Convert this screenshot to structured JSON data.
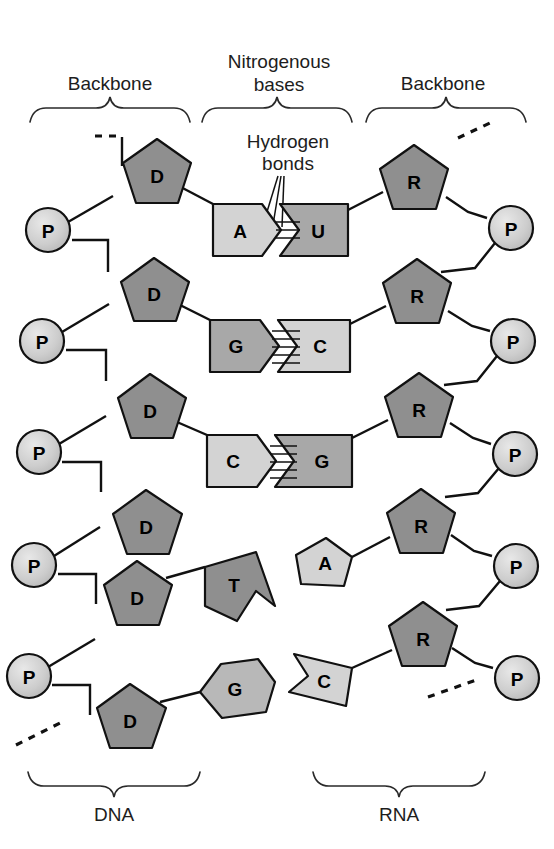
{
  "figure": {
    "title_top_left": "Backbone",
    "title_top_center_line1": "Nitrogenous",
    "title_top_center_line2": "bases",
    "title_top_right": "Backbone",
    "callout_line1": "Hydrogen",
    "callout_line2": "bonds",
    "label_bottom_left": "DNA",
    "label_bottom_right": "RNA"
  },
  "colors": {
    "sugar_fill": "#8f8f8f",
    "phosphate_fill": "#c9c9c9",
    "base_dark_fill": "#a8a8a8",
    "base_light_fill": "#d3d3d3",
    "outline": "#111111",
    "text": "#1d1d1d",
    "background": "#ffffff"
  },
  "dna": {
    "strand_label": "DNA",
    "sugar_symbol": "D",
    "sugar_name": "deoxyribose",
    "phosphate_symbol": "P",
    "sugar_count": 6,
    "phosphate_count": 5,
    "bases": [
      "A",
      "G",
      "C",
      "T",
      "G"
    ]
  },
  "rna": {
    "strand_label": "RNA",
    "sugar_symbol": "R",
    "sugar_name": "ribose",
    "phosphate_symbol": "P",
    "sugar_count": 5,
    "phosphate_count": 5,
    "bases": [
      "U",
      "C",
      "G",
      "A",
      "C"
    ]
  },
  "base_pairs": [
    {
      "left": "A",
      "right": "U",
      "left_shade": "light",
      "right_shade": "dark",
      "bond_count": 2
    },
    {
      "left": "G",
      "right": "C",
      "left_shade": "dark",
      "right_shade": "light",
      "bond_count": 3
    },
    {
      "left": "C",
      "right": "G",
      "left_shade": "light",
      "right_shade": "dark",
      "bond_count": 3
    }
  ],
  "unpaired": {
    "dna": [
      {
        "symbol": "T",
        "shade": "dark"
      },
      {
        "symbol": "G",
        "shade": "light"
      }
    ],
    "rna": [
      {
        "symbol": "A",
        "shade": "light"
      },
      {
        "symbol": "C",
        "shade": "light"
      }
    ]
  },
  "glyphs": {
    "dna_sugars": [
      "D",
      "D",
      "D",
      "D",
      "D",
      "D"
    ],
    "dna_phosphates": [
      "P",
      "P",
      "P",
      "P",
      "P"
    ],
    "rna_sugars": [
      "R",
      "R",
      "R",
      "R",
      "R"
    ],
    "rna_phosphates": [
      "P",
      "P",
      "P",
      "P",
      "P"
    ]
  }
}
